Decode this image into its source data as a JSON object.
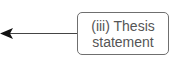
{
  "diagram": {
    "node": {
      "line1": "(iii) Thesis",
      "line2": "statement",
      "border_color": "#6f6f6f",
      "text_color": "#555555"
    },
    "arrow": {
      "direction": "left",
      "color": "#222222"
    }
  }
}
